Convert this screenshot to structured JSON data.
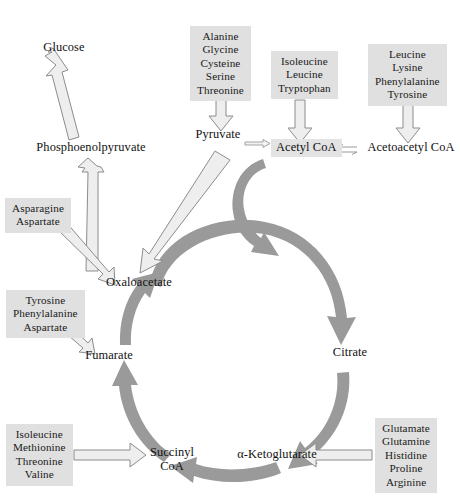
{
  "diagram": {
    "colors": {
      "cycle_arrow": "#9a9a9a",
      "box_fill": "#e0e0e0",
      "block_arrow_fill": "#eeeeee",
      "block_arrow_stroke": "#8c8c8c",
      "text": "#111111",
      "background": "#ffffff"
    }
  },
  "nodes": {
    "glucose": "Glucose",
    "phosphoenolpyruvate": "Phosphoenolpyruvate",
    "pyruvate": "Pyruvate",
    "acetyl_coa": "Acetyl CoA",
    "acetoacetyl_coa": "Acetoacetyl CoA",
    "oxaloacetate": "Oxaloacetate",
    "citrate": "Citrate",
    "alpha_ketoglutarate": "α-Ketoglutarate",
    "succinyl_coa_line1": "Succinyl",
    "succinyl_coa_line2": "CoA",
    "fumarate": "Fumarate"
  },
  "amino_acid_groups": [
    {
      "id": "to-pyruvate",
      "target": "Pyruvate",
      "members": [
        "Alanine",
        "Glycine",
        "Cysteine",
        "Serine",
        "Threonine"
      ]
    },
    {
      "id": "to-acetyl-coa",
      "target": "Acetyl CoA",
      "members": [
        "Isoleucine",
        "Leucine",
        "Tryptophan"
      ]
    },
    {
      "id": "to-acetoacetyl-coa",
      "target": "Acetoacetyl CoA",
      "members": [
        "Leucine",
        "Lysine",
        "Phenylalanine",
        "Tyrosine"
      ]
    },
    {
      "id": "to-oxaloacetate",
      "target": "Oxaloacetate",
      "members": [
        "Asparagine",
        "Aspartate"
      ]
    },
    {
      "id": "to-fumarate",
      "target": "Fumarate",
      "members": [
        "Tyrosine",
        "Phenylalanine",
        "Aspartate"
      ]
    },
    {
      "id": "to-succinyl-coa",
      "target": "Succinyl CoA",
      "members": [
        "Isoleucine",
        "Methionine",
        "Threonine",
        "Valine"
      ]
    },
    {
      "id": "to-alpha-ketoglutarate",
      "target": "α-Ketoglutarate",
      "members": [
        "Glutamate",
        "Glutamine",
        "Histidine",
        "Proline",
        "Arginine"
      ]
    }
  ],
  "cycle_steps": [
    {
      "from": "Oxaloacetate",
      "to": "Citrate"
    },
    {
      "from": "Citrate",
      "to": "α-Ketoglutarate"
    },
    {
      "from": "α-Ketoglutarate",
      "to": "Succinyl CoA"
    },
    {
      "from": "Succinyl CoA",
      "to": "Fumarate"
    },
    {
      "from": "Fumarate",
      "to": "Oxaloacetate"
    }
  ],
  "reactions": [
    {
      "from": "Phosphoenolpyruvate",
      "to": "Glucose",
      "style": "block-arrow"
    },
    {
      "from": "Oxaloacetate",
      "to": "Phosphoenolpyruvate",
      "style": "block-arrow"
    },
    {
      "from": "Pyruvate",
      "to": "Oxaloacetate",
      "style": "block-arrow"
    },
    {
      "from": "Pyruvate",
      "to": "Acetyl CoA",
      "style": "thin-arrow"
    },
    {
      "from": "Acetyl CoA",
      "to": "Acetoacetyl CoA",
      "style": "reversible"
    },
    {
      "from": "Acetyl CoA",
      "to": "cycle",
      "style": "cycle-arrow"
    }
  ]
}
